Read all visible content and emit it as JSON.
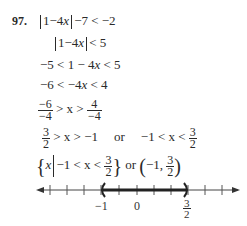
{
  "problem": {
    "number": "97.",
    "steps": [
      {
        "text": "|1 − 4x| − 7 < −2"
      },
      {
        "text": "|1 − 4x| < 5"
      },
      {
        "text": "−5 < 1 − 4x < 5"
      },
      {
        "text": "−6 < −4x < 4"
      },
      {
        "text": "−6/−4 > x > 4/−4"
      },
      {
        "text": "3/2 > x > −1 or −1 < x < 3/2"
      },
      {
        "text": "{x | −1 < x < 3/2} or (−1, 3/2)"
      }
    ],
    "step1": {
      "a": "1−4",
      "x": "x",
      "b": "−7 < −2"
    },
    "step2": {
      "a": "1−4",
      "x": "x",
      "b": "< 5"
    },
    "step3": {
      "a": "−5 < 1 − 4",
      "x": "x",
      "b": " < 5"
    },
    "step4": {
      "a": "−6 < −4",
      "x": "x",
      "b": " < 4"
    },
    "step5": {
      "n1": "−6",
      "d1": "−4",
      "mid": " > x > ",
      "n2": "4",
      "d2": "−4"
    },
    "step6": {
      "n1": "3",
      "d1": "2",
      "mid": " > x > −1",
      "or": "or",
      "left": "−1 < x < ",
      "n2": "3",
      "d2": "2"
    },
    "step7": {
      "x": "x",
      "cond": "−1 < x < ",
      "n": "3",
      "d": "2",
      "or": "or",
      "open": "(−1, ",
      "n2": "3",
      "d2": "2",
      "close": ")"
    }
  },
  "number_line": {
    "labels": [
      {
        "value": "−1"
      },
      {
        "value": "0"
      },
      {
        "value_num": "3",
        "value_den": "2"
      }
    ],
    "interval": {
      "left": "-1",
      "right": "3/2",
      "left_open": true,
      "right_open": true
    }
  }
}
